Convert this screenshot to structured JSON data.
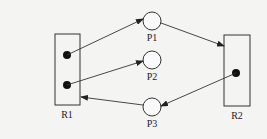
{
  "diagram": {
    "type": "resource-allocation-graph",
    "colors": {
      "stroke": "#333333",
      "background": "#f4f4f2",
      "token": "#111111"
    },
    "resources": [
      {
        "id": "R1",
        "label": "R1",
        "tokens": 2
      },
      {
        "id": "R2",
        "label": "R2",
        "tokens": 1
      }
    ],
    "processes": [
      {
        "id": "P1",
        "label": "P1"
      },
      {
        "id": "P2",
        "label": "P2"
      },
      {
        "id": "P3",
        "label": "P3"
      }
    ],
    "edges": [
      {
        "from": "R1",
        "to": "P1"
      },
      {
        "from": "R1",
        "to": "P2"
      },
      {
        "from": "P1",
        "to": "R2"
      },
      {
        "from": "R2",
        "to": "P3"
      },
      {
        "from": "P3",
        "to": "R1"
      }
    ]
  }
}
